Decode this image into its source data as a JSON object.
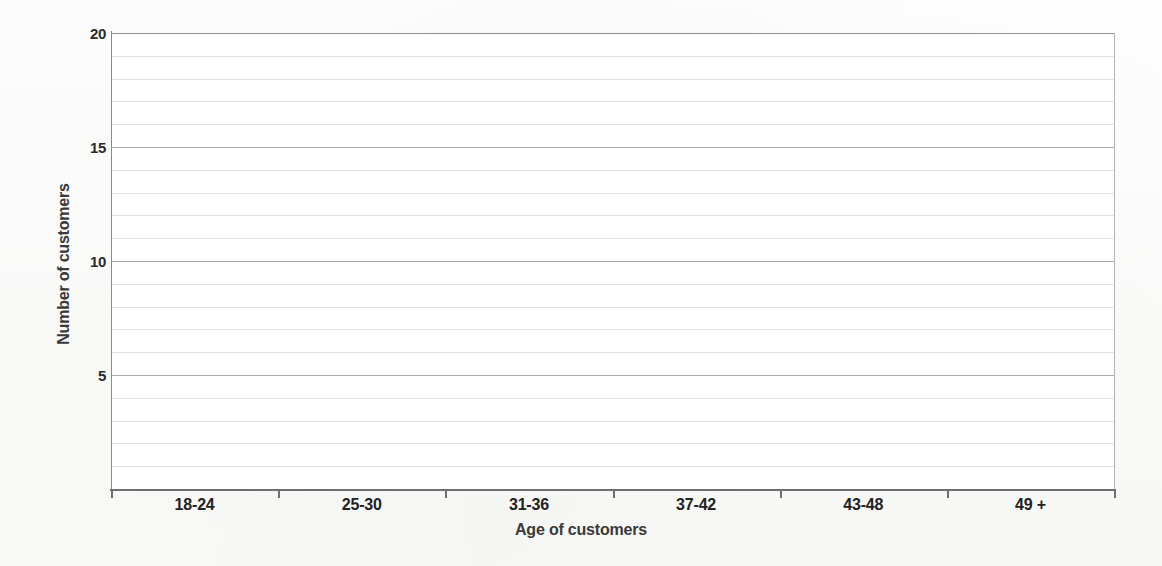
{
  "chart_data": {
    "type": "bar",
    "title": "",
    "subtitle": "",
    "xlabel": "Age of customers",
    "ylabel": "Number of customers",
    "categories": [
      "18-24",
      "25-30",
      "31-36",
      "37-42",
      "43-48",
      "49 +"
    ],
    "values": [
      null,
      null,
      null,
      null,
      null,
      null
    ],
    "series": [
      {
        "name": "Number of customers",
        "values": [
          null,
          null,
          null,
          null,
          null,
          null
        ]
      }
    ],
    "ylim": [
      0,
      20
    ],
    "y_major_ticks": [
      5,
      10,
      15,
      20
    ],
    "y_major_tick_labels": [
      "5",
      "10",
      "15",
      "20"
    ],
    "y_minor_tick_interval": 1,
    "grid": true,
    "grid_axis": "y",
    "legend": false,
    "legend_position": "none",
    "note": "Empty grid template - no data plotted"
  },
  "axes": {
    "y": {
      "title": "Number of customers",
      "ticks": [
        {
          "value": 20,
          "label": "20",
          "major": true
        },
        {
          "value": 19,
          "label": "",
          "major": false
        },
        {
          "value": 18,
          "label": "",
          "major": false
        },
        {
          "value": 17,
          "label": "",
          "major": false
        },
        {
          "value": 16,
          "label": "",
          "major": false
        },
        {
          "value": 15,
          "label": "15",
          "major": true
        },
        {
          "value": 14,
          "label": "",
          "major": false
        },
        {
          "value": 13,
          "label": "",
          "major": false
        },
        {
          "value": 12,
          "label": "",
          "major": false
        },
        {
          "value": 11,
          "label": "",
          "major": false
        },
        {
          "value": 10,
          "label": "10",
          "major": true
        },
        {
          "value": 9,
          "label": "",
          "major": false
        },
        {
          "value": 8,
          "label": "",
          "major": false
        },
        {
          "value": 7,
          "label": "",
          "major": false
        },
        {
          "value": 6,
          "label": "",
          "major": false
        },
        {
          "value": 5,
          "label": "5",
          "major": true
        },
        {
          "value": 4,
          "label": "",
          "major": false
        },
        {
          "value": 3,
          "label": "",
          "major": false
        },
        {
          "value": 2,
          "label": "",
          "major": false
        },
        {
          "value": 1,
          "label": "",
          "major": false
        }
      ]
    },
    "x": {
      "title": "Age of customers",
      "categories": [
        {
          "label": "18-24"
        },
        {
          "label": "25-30"
        },
        {
          "label": "31-36"
        },
        {
          "label": "37-42"
        },
        {
          "label": "43-48"
        },
        {
          "label": "49 +"
        }
      ],
      "tick_count": 7
    }
  },
  "colors": {
    "page_background": "#fdfdfc",
    "plot_background": "#ffffff",
    "axis_line": "#6f6f6f",
    "gridline_major": "#a9a9a9",
    "gridline_minor": "#e2e2e2",
    "label_text": "#222222",
    "title_text": "#3a3a3a"
  }
}
